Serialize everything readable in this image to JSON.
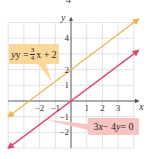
{
  "figure_fragment": "4",
  "chart_data": {
    "type": "line",
    "title": "",
    "xlabel": "x",
    "ylabel": "y",
    "xlim": [
      -4,
      4.3
    ],
    "ylim": [
      -3,
      5.3
    ],
    "grid": true,
    "x_ticks": [
      -2,
      -1,
      1,
      2,
      3
    ],
    "y_ticks": [
      4,
      2,
      1,
      -1,
      -2
    ],
    "x_tick_labels": [
      "−2",
      "−1",
      "1",
      "2",
      "3"
    ],
    "y_tick_labels": [
      "4",
      "2",
      "1",
      "−1",
      "−2"
    ],
    "series": [
      {
        "name": "y = 3/4 x + 2",
        "equation": "y = (3/4)x + 2",
        "slope": 0.75,
        "intercept": 2,
        "x_range": [
          -4,
          4.3
        ],
        "color": "#f0b35a",
        "arrows": "both"
      },
      {
        "name": "3x − 4y = 0",
        "equation": "3x - 4y = 0",
        "slope": 0.75,
        "intercept": 0,
        "x_range": [
          -4,
          4.3
        ],
        "color": "#e04a6a",
        "arrows": "both"
      }
    ],
    "annotations": [
      {
        "series": 0,
        "text_parts": {
          "lhs": "y = ",
          "num": "3",
          "den": "4",
          "rhs": "x + 2"
        },
        "box_color": "#fbd79a",
        "position": "upper-left"
      },
      {
        "series": 1,
        "text_parts": {
          "lhs": "3",
          "x": "x",
          "mid": " − 4",
          "y": "y",
          "rhs": " = 0"
        },
        "box_color": "#f8c4c2",
        "position": "lower-right"
      }
    ]
  }
}
